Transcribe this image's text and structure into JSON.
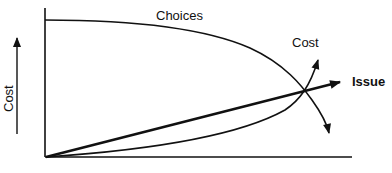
{
  "diagram": {
    "type": "conceptual-curve-diagram",
    "labels": {
      "choices": "Choices",
      "cost_curve": "Cost",
      "issue_line": "Issue",
      "y_axis": "Cost"
    },
    "colors": {
      "line": "#111111",
      "background": "#ffffff"
    },
    "elements": [
      {
        "name": "choices-curve",
        "label": "Choices",
        "shape": "decreasing concave curve, starts high at left, falls steeply at right, ends with downward arrow"
      },
      {
        "name": "issue-line",
        "label": "Issue",
        "shape": "thick straight line from origin rising to the right, ends with arrow"
      },
      {
        "name": "cost-curve",
        "label": "Cost",
        "shape": "increasing convex curve from origin, rises steeply at right, ends with upward arrow"
      },
      {
        "name": "y-axis-arrow",
        "label": "Cost",
        "shape": "upward arrow beside vertical axis"
      }
    ]
  }
}
